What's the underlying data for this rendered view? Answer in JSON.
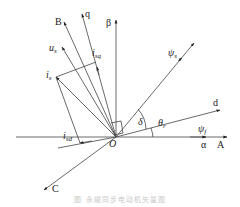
{
  "figure": {
    "type": "vector-diagram",
    "origin_label": "O",
    "axes": {
      "stator_A": "A",
      "stator_B": "B",
      "stator_C": "C",
      "alpha": "α",
      "beta": "β",
      "d": "d",
      "q": "q"
    },
    "vectors": {
      "us": {
        "base": "u",
        "sub": "s"
      },
      "is": {
        "base": "i",
        "sub": "s"
      },
      "isq": {
        "base": "i",
        "sub": "sq"
      },
      "isd": {
        "base": "i",
        "sub": "sd"
      },
      "psi_s": {
        "base": "ψ",
        "sub": "s"
      },
      "psi_f": {
        "base": "ψ",
        "sub": "f"
      }
    },
    "angles": {
      "delta": "δ",
      "theta_r": {
        "base": "θ",
        "sub": "r"
      }
    },
    "caption": "图 永磁同步电动机矢量图"
  }
}
